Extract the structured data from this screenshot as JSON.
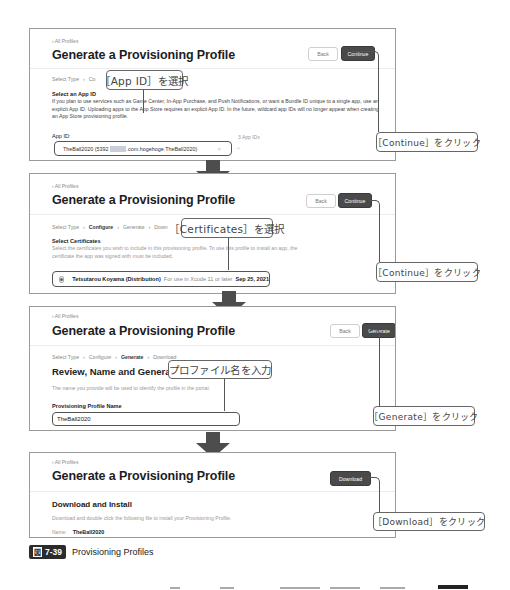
{
  "figure": {
    "badge_kanji": "図",
    "number": "7-39",
    "caption": "Provisioning Profiles"
  },
  "panels": [
    {
      "crumb": "‹ All Profiles",
      "title": "Generate a Provisioning Profile",
      "back_label": "Back",
      "primary_label": "Continue",
      "steps": [
        "Select Type",
        "Co",
        "load"
      ],
      "section_heading": "Select an App ID",
      "description": "If you plan to use services such as Game Center, In-App Purchase, and Push Notifications, or want a Bundle ID unique to a single app, use an explicit App ID. Uploading apps to the App Store requires an explicit App ID. In the future, wildcard app IDs will no longer appear when creating an App Store provisioning profile.",
      "field_label": "App ID:",
      "app_id_count": "3 App IDs",
      "app_id_value_prefix": "TheBall2020 (5392",
      "app_id_value_suffix": ".com.hogehoge.TheBall2020)",
      "clear_glyph": "×",
      "chevron_glyph": "⌄",
      "callout_select": "［App ID］を選択",
      "callout_click": "［Continue］をクリック"
    },
    {
      "crumb": "‹ All Profiles",
      "title": "Generate a Provisioning Profile",
      "back_label": "Back",
      "primary_label": "Continue",
      "steps": [
        "Select Type",
        "Configure",
        "Generate",
        "Down"
      ],
      "section_heading": "Select Certificates",
      "description": "Select the certificates you wish to include in this provisioning profile. To use this profile to install an app, the certificate the app was signed with must be included.",
      "cert_name": "Tetsutarou Koyama (Distribution)",
      "cert_note": "For use in Xcode 11 or later",
      "cert_date": "Sep 25, 2021",
      "callout_select": "［Certificates］を選択",
      "callout_click": "［Continue］をクリック"
    },
    {
      "crumb": "‹ All Profiles",
      "title": "Generate a Provisioning Profile",
      "back_label": "Back",
      "primary_label": "Generate",
      "steps": [
        "Select Type",
        "Configure",
        "Generate",
        "Download"
      ],
      "section_heading": "Review, Name and Generate.",
      "description": "The name you provide will be used to identify the profile in the portal.",
      "field_label": "Provisioning Profile Name",
      "name_value": "TheBall2020",
      "callout_input": "プロファイル名を入力",
      "callout_click": "［Generate］をクリック"
    },
    {
      "crumb": "‹ All Profiles",
      "title": "Generate a Provisioning Profile",
      "primary_label": "Download",
      "section_heading": "Download and Install",
      "description": "Download and double click the following file to install your Provisioning Profile.",
      "name_label": "Name:",
      "name_value": "TheBall2020",
      "callout_click": "［Download］をクリック"
    }
  ]
}
